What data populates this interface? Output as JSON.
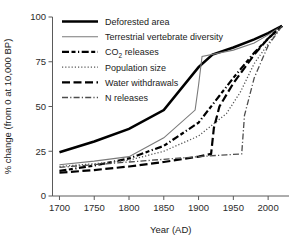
{
  "chart_data": {
    "type": "line",
    "title": "",
    "xlabel": "Year (AD)",
    "ylabel": "% change (from 0 at 10,000 BP)",
    "xlim": [
      1690,
      2030
    ],
    "ylim": [
      0,
      100
    ],
    "xticks": [
      1700,
      1750,
      1800,
      1850,
      1900,
      1950,
      2000
    ],
    "xtick_labels": [
      "1700",
      "1750",
      "1800",
      "1850",
      "1900",
      "1950",
      "2000"
    ],
    "yticks": [
      0,
      25,
      50,
      75,
      100
    ],
    "ytick_labels": [
      "0",
      "25",
      "50",
      "75",
      "100"
    ],
    "grid": false,
    "legend_position": "top-left",
    "series": [
      {
        "name": "Deforested area",
        "style": "solid-thick",
        "color": "#000000",
        "width": 2.6,
        "x": [
          1700,
          1750,
          1800,
          1850,
          1900,
          1920,
          1950,
          1980,
          2000,
          2020
        ],
        "y": [
          24.5,
          30.5,
          37.5,
          48.0,
          72.0,
          79.0,
          83.0,
          87.5,
          91.0,
          95.0
        ]
      },
      {
        "name": "Terrestrial vertebrate diversity",
        "style": "solid-thin",
        "color": "#7a7a7a",
        "width": 1.1,
        "x": [
          1700,
          1750,
          1800,
          1850,
          1895,
          1900,
          1905,
          1950,
          1980,
          2000,
          2020
        ],
        "y": [
          17.5,
          19.5,
          22.0,
          32.5,
          48.0,
          62.0,
          78.0,
          81.5,
          85.5,
          90.0,
          95.0
        ]
      },
      {
        "name": "CO2 releases",
        "style": "dash-dash-dot",
        "color": "#000000",
        "width": 2.2,
        "x": [
          1700,
          1750,
          1800,
          1850,
          1900,
          1930,
          1950,
          1980,
          2000,
          2020
        ],
        "y": [
          14.0,
          17.0,
          21.0,
          28.0,
          41.0,
          56.0,
          66.0,
          80.0,
          88.0,
          95.0
        ]
      },
      {
        "name": "Population size",
        "style": "dotted",
        "color": "#555555",
        "width": 1.3,
        "x": [
          1700,
          1750,
          1800,
          1850,
          1900,
          1940,
          1960,
          1980,
          2000,
          2020
        ],
        "y": [
          16.5,
          18.0,
          20.0,
          25.0,
          33.5,
          46.0,
          58.0,
          74.0,
          85.0,
          95.0
        ]
      },
      {
        "name": "Water withdrawals",
        "style": "long-dash",
        "color": "#000000",
        "width": 2.2,
        "x": [
          1700,
          1750,
          1800,
          1850,
          1900,
          1918,
          1922,
          1930,
          1950,
          1980,
          2000,
          2020
        ],
        "y": [
          13.0,
          14.5,
          16.5,
          19.0,
          22.0,
          23.5,
          38.0,
          50.0,
          63.0,
          79.0,
          88.0,
          95.0
        ]
      },
      {
        "name": "N releases",
        "style": "dash-dot",
        "color": "#4d4d4d",
        "width": 1.3,
        "x": [
          1700,
          1750,
          1800,
          1850,
          1900,
          1940,
          1962,
          1966,
          1980,
          2000,
          2020
        ],
        "y": [
          16.0,
          17.5,
          19.0,
          20.5,
          22.0,
          23.0,
          23.5,
          45.0,
          66.0,
          84.0,
          95.0
        ]
      }
    ],
    "legend_entries": [
      {
        "label": "Deforested area",
        "label_suffix": "",
        "sub": ""
      },
      {
        "label": "Terrestrial vertebrate diversity",
        "label_suffix": "",
        "sub": ""
      },
      {
        "label": "CO",
        "label_suffix": " releases",
        "sub": "2"
      },
      {
        "label": "Population size",
        "label_suffix": "",
        "sub": ""
      },
      {
        "label": "Water withdrawals",
        "label_suffix": "",
        "sub": ""
      },
      {
        "label": "N releases",
        "label_suffix": "",
        "sub": ""
      }
    ]
  }
}
